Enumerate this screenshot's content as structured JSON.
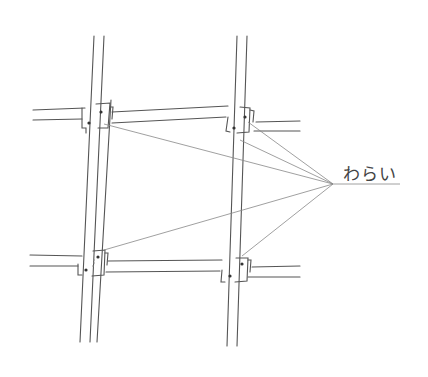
{
  "diagram": {
    "label": "わらい",
    "line_color": "#555555",
    "leader_color": "#888888"
  }
}
